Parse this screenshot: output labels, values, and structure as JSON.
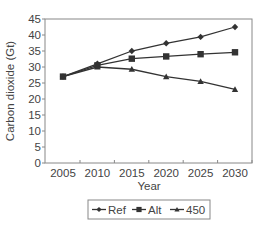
{
  "chart_data": {
    "type": "line",
    "title": "",
    "xlabel": "Year",
    "ylabel": "Carbon dioxide (Gt)",
    "x": [
      2005,
      2010,
      2015,
      2020,
      2025,
      2030
    ],
    "xticks": [
      "2005",
      "2010",
      "2015",
      "2020",
      "2025",
      "2030"
    ],
    "yticks": [
      "0",
      "5",
      "10",
      "15",
      "20",
      "25",
      "30",
      "35",
      "40",
      "45"
    ],
    "ylim": [
      0,
      45
    ],
    "grid": false,
    "legend_position": "bottom",
    "series": [
      {
        "name": "Ref",
        "marker": "diamond",
        "values": [
          27,
          31,
          35,
          37.4,
          39.4,
          42.5
        ]
      },
      {
        "name": "Alt",
        "marker": "square",
        "values": [
          27,
          30.5,
          32.6,
          33.3,
          34,
          34.6
        ]
      },
      {
        "name": "450",
        "marker": "triangle",
        "values": [
          27,
          30,
          29.3,
          27,
          25.5,
          23
        ]
      }
    ],
    "colors": {
      "line": "#333333",
      "frame": "#888888",
      "text": "#444444"
    }
  }
}
